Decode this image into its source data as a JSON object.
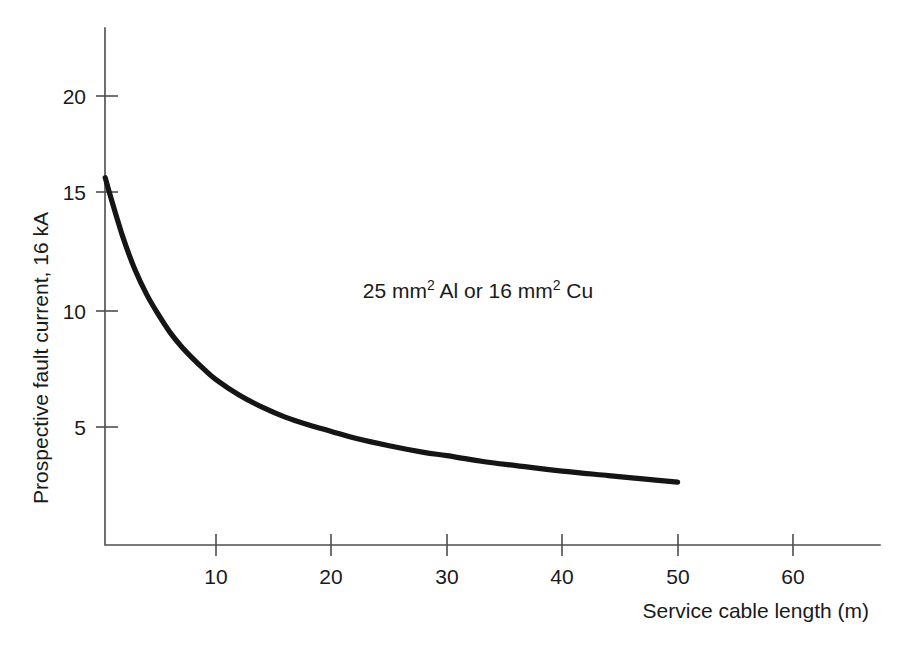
{
  "chart_data": {
    "type": "line",
    "title": "",
    "subtitle": "",
    "xlabel": "Service cable length (m)",
    "ylabel": "Prospective fault current, 16 kA",
    "xlim": [
      0,
      67
    ],
    "ylim": [
      0,
      23.5
    ],
    "xticks": [
      10,
      20,
      30,
      40,
      50,
      60
    ],
    "xticklabels": [
      "10",
      "20",
      "30",
      "40",
      "50",
      "60"
    ],
    "yticks": [
      5,
      10,
      15,
      20
    ],
    "yticklabels": [
      "5",
      "10",
      "15",
      "20"
    ],
    "grid": false,
    "legend": null,
    "annotations": [
      {
        "id": "cable-spec",
        "text_plain": "25 mm2 Al or 16 mm2 Cu",
        "parts": [
          {
            "text": "25 mm",
            "sup": false
          },
          {
            "text": "2",
            "sup": true
          },
          {
            "text": " Al or 16 mm",
            "sup": false
          },
          {
            "text": "2",
            "sup": true
          },
          {
            "text": " Cu",
            "sup": false
          }
        ],
        "x": 22.5,
        "y": 11.4
      }
    ],
    "series": [
      {
        "name": "Prospective fault current",
        "color": "#151515",
        "x": [
          0.4,
          1,
          2,
          3,
          4,
          5,
          6,
          7,
          8,
          9,
          10,
          12,
          14,
          16,
          18,
          20,
          22,
          25,
          28,
          30,
          33,
          36,
          40,
          44,
          47,
          50
        ],
        "y": [
          16.3,
          15.2,
          13.5,
          12.1,
          11.0,
          10.1,
          9.3,
          8.65,
          8.1,
          7.6,
          7.15,
          6.45,
          5.9,
          5.45,
          5.1,
          4.8,
          4.5,
          4.15,
          3.85,
          3.7,
          3.45,
          3.25,
          3.0,
          2.8,
          2.65,
          2.5
        ]
      }
    ]
  },
  "axes": {
    "y_axis_title": "Prospective fault current, 16 kA",
    "x_axis_title": "Service cable length (m)"
  }
}
